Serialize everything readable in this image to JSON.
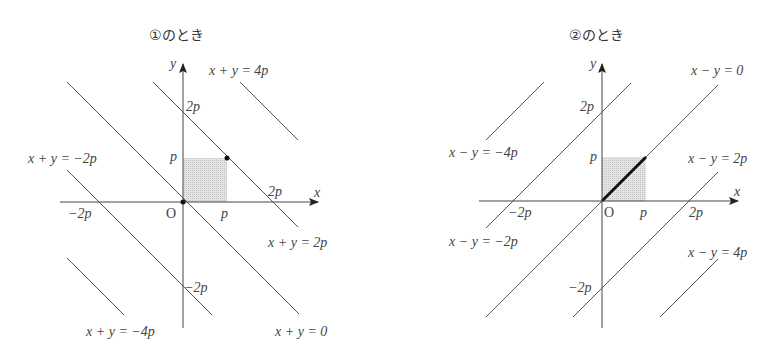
{
  "diagrams": [
    {
      "title": "①のとき",
      "axis_x_label": "x",
      "axis_y_label": "y",
      "origin_label": "O",
      "tick_labels": {
        "x_p": "p",
        "x_2p": "2p",
        "x_neg2p": "−2p",
        "y_p": "p",
        "y_2p": "2p",
        "y_neg2p": "−2p"
      },
      "line_labels": {
        "l4p": "x + y = 4p",
        "lneg2p": "x + y = −2p",
        "l2p": "x + y = 2p",
        "lneg4p": "x + y = −4p",
        "l0": "x + y = 0"
      },
      "lines": [
        "x + y = 4p",
        "x + y = 2p",
        "x + y = 0",
        "x + y = −2p",
        "x + y = −4p"
      ],
      "shaded_region": "0 ≤ x ≤ p, 0 ≤ y ≤ p",
      "marked_points": [
        "(0,0)",
        "(p,p)"
      ]
    },
    {
      "title": "②のとき",
      "axis_x_label": "x",
      "axis_y_label": "y",
      "origin_label": "O",
      "tick_labels": {
        "x_p": "p",
        "x_2p": "2p",
        "x_neg2p": "−2p",
        "y_p": "p",
        "y_2p": "2p",
        "y_neg2p": "−2p"
      },
      "line_labels": {
        "l0": "x − y = 0",
        "lneg4p": "x − y = −4p",
        "l2p": "x − y = 2p",
        "lneg2p": "x − y = −2p",
        "l4p": "x − y = 4p"
      },
      "lines": [
        "x − y = −4p",
        "x − y = −2p",
        "x − y = 0",
        "x − y = 2p",
        "x − y = 4p"
      ],
      "shaded_region": "0 ≤ x ≤ p, 0 ≤ y ≤ p",
      "highlighted_segment": "from (0,0) to (p,p) on x − y = 0"
    }
  ],
  "colors": {
    "line": "#555555",
    "axis": "#444444",
    "shade": "#d8d8d8",
    "bold_segment": "#111111"
  }
}
